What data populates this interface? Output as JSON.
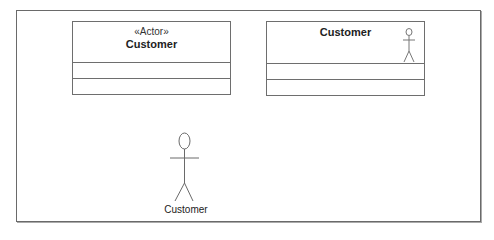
{
  "diagram": {
    "type": "UML actor notations",
    "left_box": {
      "stereotype": "«Actor»",
      "name": "Customer",
      "compartments": 2
    },
    "right_box": {
      "name": "Customer",
      "icon": "stick-figure-icon",
      "compartments": 2
    },
    "stick_actor": {
      "label": "Customer",
      "icon": "stick-figure-icon"
    },
    "colors": {
      "line": "#6e6e6e",
      "text": "#222222",
      "background": "#ffffff"
    }
  }
}
